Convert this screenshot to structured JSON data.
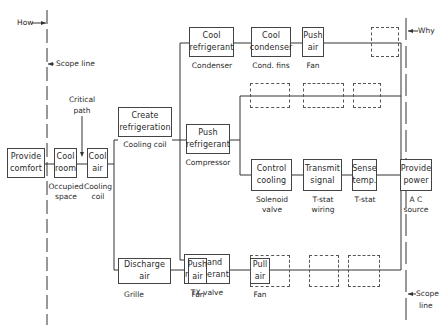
{
  "diagram": {
    "type": "FAST function analysis diagram",
    "annotations": {
      "how": "How",
      "why": "Why",
      "scope_line_left": "Scope line",
      "scope_line_right_1": "Scope",
      "scope_line_right_2": "line",
      "critical_path_1": "Critical",
      "critical_path_2": "path"
    },
    "functions": {
      "provide_comfort": {
        "l1": "Provide",
        "l2": "comfort"
      },
      "cool_room": {
        "l1": "Cool",
        "l2": "room",
        "c1": "Occupied",
        "c2": "space"
      },
      "cool_air": {
        "l1": "Cool",
        "l2": "air",
        "c1": "Cooling",
        "c2": "coil"
      },
      "create_refrigeration": {
        "l1": "Create",
        "l2": "refrigeration",
        "c1": "Cooling coil"
      },
      "cool_refrigerant": {
        "l1": "Cool",
        "l2": "refrigerant",
        "c1": "Condenser"
      },
      "cool_condenser": {
        "l1": "Cool",
        "l2": "condenser",
        "c1": "Cond. fins"
      },
      "push_air_top": {
        "l1": "Push",
        "l2": "air",
        "c1": "Fan"
      },
      "push_refrigerant": {
        "l1": "Push",
        "l2": "refrigerant",
        "c1": "Compressor"
      },
      "control_cooling": {
        "l1": "Control",
        "l2": "cooling",
        "c1": "Solenoid",
        "c2": "valve"
      },
      "transmit_signal": {
        "l1": "Transmit",
        "l2": "signal",
        "c1": "T-stat",
        "c2": "wiring"
      },
      "sense_temp": {
        "l1": "Sense",
        "l2": "temp.",
        "c1": "T-stat"
      },
      "provide_power": {
        "l1": "Provide",
        "l2": "power",
        "c1": "A C",
        "c2": "source"
      },
      "expand_refrigerant": {
        "l1": "Expand",
        "l2": "refrigerant",
        "c1": "TX valve"
      },
      "discharge_air": {
        "l1": "Discharge",
        "l2": "air",
        "c1": "Grille"
      },
      "push_air_bottom": {
        "l1": "Push",
        "l2": "air",
        "c1": "Fan"
      },
      "pull_air": {
        "l1": "Pull",
        "l2": "air",
        "c1": "Fan"
      }
    }
  }
}
